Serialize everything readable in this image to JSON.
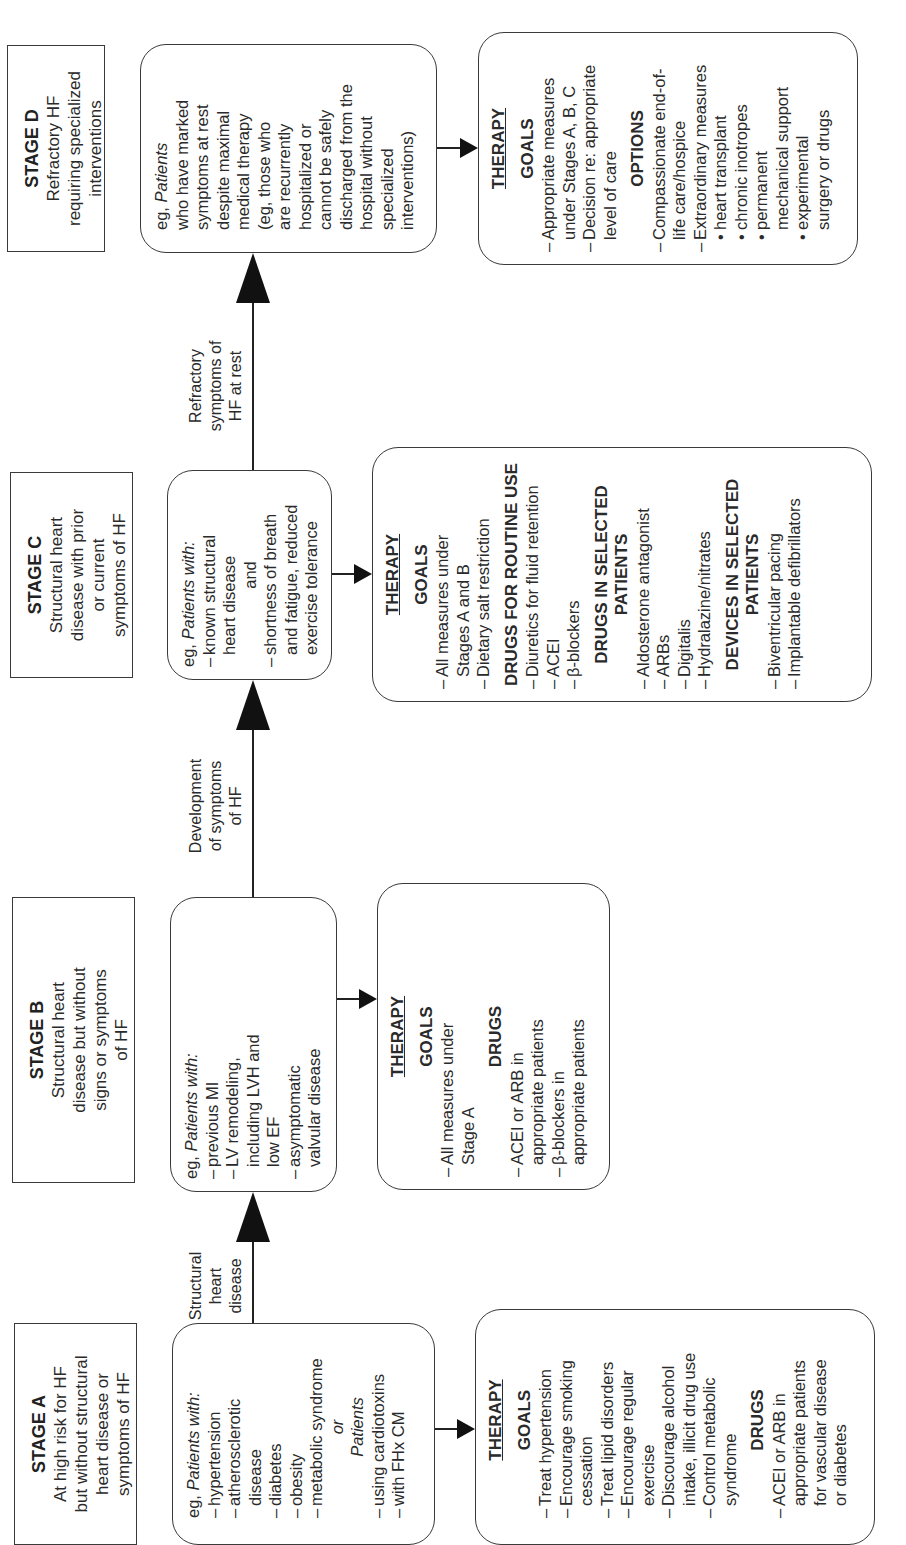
{
  "stages": [
    {
      "id": "A",
      "title": "STAGE A",
      "description": [
        "At high risk for HF",
        "but without structural",
        "heart disease or",
        "symptoms of HF"
      ],
      "patients": {
        "intro_eg": "eg, ",
        "intro_italic": "Patients with:",
        "items": [
          "hypertension",
          "atherosclerotic",
          "disease",
          "diabetes",
          "obesity",
          "metabolic syndrome"
        ],
        "or_label": "or",
        "patients2_label": "Patients",
        "items2": [
          "using cardiotoxins",
          "with FHx CM"
        ]
      },
      "therapy": {
        "title": "THERAPY",
        "sections": [
          {
            "heading": "GOALS",
            "lines": [
              {
                "t": "Treat hypertension",
                "k": "dash"
              },
              {
                "t": "Encourage smoking",
                "k": "dash"
              },
              {
                "t": "cessation",
                "k": "indent"
              },
              {
                "t": "Treat lipid disorders",
                "k": "dash"
              },
              {
                "t": "Encourage regular",
                "k": "dash"
              },
              {
                "t": "exercise",
                "k": "indent"
              },
              {
                "t": "Discourage alcohol",
                "k": "dash"
              },
              {
                "t": "intake, illicit drug use",
                "k": "indent"
              },
              {
                "t": "Control metabolic",
                "k": "dash"
              },
              {
                "t": "syndrome",
                "k": "indent"
              }
            ]
          },
          {
            "heading": "DRUGS",
            "lines": [
              {
                "t": "ACEI or ARB in",
                "k": "dash"
              },
              {
                "t": "appropriate patients",
                "k": "indent"
              },
              {
                "t": "for vascular disease",
                "k": "indent"
              },
              {
                "t": "or diabetes",
                "k": "indent"
              }
            ]
          }
        ]
      }
    },
    {
      "id": "B",
      "title": "STAGE B",
      "description": [
        "Structural heart",
        "disease but without",
        "signs or symptoms",
        "of HF"
      ],
      "patients": {
        "intro_eg": "eg, ",
        "intro_italic": "Patients with:",
        "lines": [
          {
            "t": "previous MI",
            "k": "dash"
          },
          {
            "t": "LV remodeling,",
            "k": "dash"
          },
          {
            "t": "including LVH and",
            "k": "indent"
          },
          {
            "t": "low EF",
            "k": "indent"
          },
          {
            "t": "asymptomatic",
            "k": "dash"
          },
          {
            "t": "valvular disease",
            "k": "indent"
          }
        ]
      },
      "therapy": {
        "title": "THERAPY",
        "sections": [
          {
            "heading": "GOALS",
            "lines": [
              {
                "t": "All measures under",
                "k": "dash"
              },
              {
                "t": "Stage A",
                "k": "indent"
              }
            ]
          },
          {
            "heading": "DRUGS",
            "lines": [
              {
                "t": "ACEI or ARB in",
                "k": "dash"
              },
              {
                "t": "appropriate patients",
                "k": "indent"
              },
              {
                "t": "β-blockers in",
                "k": "dash"
              },
              {
                "t": "appropriate patients",
                "k": "indent"
              }
            ]
          }
        ]
      }
    },
    {
      "id": "C",
      "title": "STAGE C",
      "description": [
        "Structural heart",
        "disease with prior",
        "or current",
        "symptoms of HF"
      ],
      "patients": {
        "intro_eg": "eg, ",
        "intro_italic": "Patients with:",
        "lines": [
          {
            "t": "known structural",
            "k": "dash"
          },
          {
            "t": "heart disease",
            "k": "indent"
          },
          {
            "t": "and",
            "k": "center"
          },
          {
            "t": "shortness of breath",
            "k": "dash"
          },
          {
            "t": "and fatigue, reduced",
            "k": "indent"
          },
          {
            "t": "exercise tolerance",
            "k": "indent"
          }
        ]
      },
      "therapy": {
        "title": "THERAPY",
        "sections": [
          {
            "heading": "GOALS",
            "lines": [
              {
                "t": "All measures under",
                "k": "dash"
              },
              {
                "t": "Stages A and B",
                "k": "indent"
              },
              {
                "t": "Dietary salt restriction",
                "k": "dash"
              }
            ]
          },
          {
            "heading": "DRUGS FOR ROUTINE USE",
            "lines": [
              {
                "t": "Diuretics for fluid retention",
                "k": "dash"
              },
              {
                "t": "ACEI",
                "k": "dash"
              },
              {
                "t": "β-blockers",
                "k": "dash"
              }
            ]
          },
          {
            "heading": "DRUGS IN SELECTED PATIENTS",
            "lines": [
              {
                "t": "Aldosterone antagonist",
                "k": "dash"
              },
              {
                "t": "ARBs",
                "k": "dash"
              },
              {
                "t": "Digitalis",
                "k": "dash"
              },
              {
                "t": "Hydralazine/nitrates",
                "k": "dash"
              }
            ]
          },
          {
            "heading": "DEVICES IN SELECTED PATIENTS",
            "lines": [
              {
                "t": "Biventricular pacing",
                "k": "dash"
              },
              {
                "t": "Implantable defibrillators",
                "k": "dash"
              }
            ]
          }
        ]
      }
    },
    {
      "id": "D",
      "title": "STAGE D",
      "description": [
        "Refractory HF",
        "requiring specialized",
        "interventions"
      ],
      "patients": {
        "intro_eg": "eg, ",
        "intro_italic": "Patients",
        "lines": [
          {
            "t": "who have marked",
            "k": "plain"
          },
          {
            "t": "symptoms at rest",
            "k": "plain"
          },
          {
            "t": "despite maximal",
            "k": "plain"
          },
          {
            "t": "medical therapy",
            "k": "plain"
          },
          {
            "t": "(eg, those who",
            "k": "plain"
          },
          {
            "t": "are recurrently",
            "k": "plain"
          },
          {
            "t": "hospitalized or",
            "k": "plain"
          },
          {
            "t": "cannot be safely",
            "k": "plain"
          },
          {
            "t": "discharged from the",
            "k": "plain"
          },
          {
            "t": "hospital without",
            "k": "plain"
          },
          {
            "t": "specialized",
            "k": "plain"
          },
          {
            "t": "interventions)",
            "k": "plain"
          }
        ]
      },
      "therapy": {
        "title": "THERAPY",
        "sections": [
          {
            "heading": "GOALS",
            "lines": [
              {
                "t": "Appropriate measures",
                "k": "dash"
              },
              {
                "t": "under Stages A, B, C",
                "k": "indent"
              },
              {
                "t": "Decision re: appropriate",
                "k": "dash"
              },
              {
                "t": "level of care",
                "k": "indent"
              }
            ]
          },
          {
            "heading": "OPTIONS",
            "lines": [
              {
                "t": "Compassionate end-of-",
                "k": "dash"
              },
              {
                "t": "life care/hospice",
                "k": "indent"
              },
              {
                "t": "Extraordinary measures",
                "k": "dash"
              },
              {
                "t": "heart transplant",
                "k": "bullet"
              },
              {
                "t": "chronic inotropes",
                "k": "bullet"
              },
              {
                "t": "permanent",
                "k": "bullet"
              },
              {
                "t": "mechanical support",
                "k": "bullet2"
              },
              {
                "t": "experimental",
                "k": "bullet"
              },
              {
                "t": "surgery or drugs",
                "k": "bullet2"
              }
            ]
          }
        ]
      }
    }
  ],
  "transitions": [
    {
      "from": "A",
      "to": "B",
      "label": [
        "Structural",
        "heart",
        "disease"
      ]
    },
    {
      "from": "B",
      "to": "C",
      "label": [
        "Development",
        "of symptoms",
        "of HF"
      ]
    },
    {
      "from": "C",
      "to": "D",
      "label": [
        "Refractory",
        "symptoms of",
        "HF at rest"
      ]
    }
  ]
}
